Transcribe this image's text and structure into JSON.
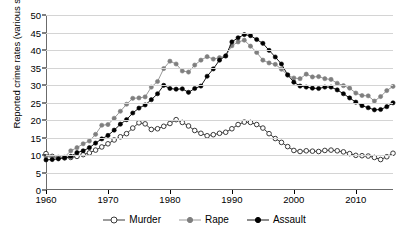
{
  "chart_data": {
    "type": "line",
    "title": "",
    "xlabel": "",
    "ylabel": "Reported crime rates (various scales)",
    "xlim": [
      1960,
      2016
    ],
    "ylim": [
      0,
      50
    ],
    "ytick_values": [
      0,
      5,
      10,
      15,
      20,
      25,
      30,
      35,
      40,
      45,
      50
    ],
    "ytick_labels": [
      "0",
      "5",
      "10",
      "15",
      "20",
      "25",
      "30",
      "35",
      "40",
      "45",
      "50"
    ],
    "xtick_values": [
      1960,
      1970,
      1980,
      1990,
      2000,
      2010
    ],
    "xtick_labels": [
      "1960",
      "1970",
      "1980",
      "1990",
      "2000",
      "2010"
    ],
    "grid": "horizontal",
    "legend_position": "bottom",
    "x": [
      1960,
      1961,
      1962,
      1963,
      1964,
      1965,
      1966,
      1967,
      1968,
      1969,
      1970,
      1971,
      1972,
      1973,
      1974,
      1975,
      1976,
      1977,
      1978,
      1979,
      1980,
      1981,
      1982,
      1983,
      1984,
      1985,
      1986,
      1987,
      1988,
      1989,
      1990,
      1991,
      1992,
      1993,
      1994,
      1995,
      1996,
      1997,
      1998,
      1999,
      2000,
      2001,
      2002,
      2003,
      2004,
      2005,
      2006,
      2007,
      2008,
      2009,
      2010,
      2011,
      2012,
      2013,
      2014,
      2015,
      2016
    ],
    "series": [
      {
        "name": "Murder",
        "color": "#ffffff",
        "line_color": "#3a3a3a",
        "marker": "open-circle",
        "values": [
          10.4,
          9.6,
          9.2,
          9.2,
          9.3,
          9.6,
          10.1,
          10.6,
          11.4,
          12.3,
          13.2,
          14.3,
          15.2,
          16.1,
          17.7,
          19.2,
          18.9,
          17.3,
          17.5,
          18.2,
          19.0,
          20.1,
          19.3,
          18.3,
          17.0,
          16.2,
          15.5,
          15.8,
          16.2,
          16.5,
          17.5,
          18.7,
          19.4,
          19.3,
          18.7,
          17.7,
          16.1,
          14.7,
          13.6,
          12.4,
          11.3,
          11.0,
          11.2,
          11.1,
          11.0,
          11.3,
          11.4,
          11.2,
          10.9,
          10.4,
          9.9,
          9.8,
          9.7,
          9.3,
          8.7,
          9.5,
          10.5
        ]
      },
      {
        "name": "Rape",
        "color": "#7f7f7f",
        "line_color": "#9a9a9a",
        "marker": "filled-circle",
        "values": [
          9.6,
          9.4,
          9.4,
          9.4,
          11.2,
          12.1,
          13.2,
          14.0,
          15.9,
          18.5,
          18.7,
          20.5,
          22.5,
          24.5,
          26.2,
          26.3,
          26.6,
          29.4,
          31.0,
          34.7,
          36.8,
          36.0,
          34.0,
          33.7,
          35.7,
          37.1,
          38.1,
          37.4,
          37.8,
          38.3,
          41.2,
          42.3,
          42.8,
          41.1,
          39.3,
          37.1,
          36.3,
          35.9,
          34.5,
          32.8,
          32.0,
          31.8,
          33.1,
          32.3,
          32.4,
          31.8,
          31.6,
          30.5,
          29.8,
          29.1,
          27.7,
          27.0,
          26.9,
          25.4,
          26.7,
          28.4,
          29.6
        ]
      },
      {
        "name": "Assault",
        "color": "#000000",
        "line_color": "#1a1a1a",
        "marker": "filled-circle",
        "values": [
          8.6,
          8.7,
          8.9,
          9.2,
          9.6,
          10.7,
          11.2,
          12.1,
          13.4,
          14.6,
          15.6,
          17.1,
          18.8,
          20.1,
          22.0,
          23.4,
          24.3,
          25.8,
          27.5,
          29.9,
          29.0,
          28.8,
          28.9,
          27.9,
          29.0,
          29.7,
          32.5,
          34.6,
          37.1,
          38.3,
          42.3,
          43.5,
          44.4,
          44.1,
          43.0,
          41.9,
          39.9,
          38.0,
          36.0,
          32.9,
          30.8,
          29.7,
          29.4,
          29.1,
          29.0,
          29.4,
          29.4,
          28.6,
          27.5,
          26.3,
          25.1,
          24.1,
          23.5,
          22.9,
          23.0,
          23.8,
          24.9
        ]
      }
    ]
  },
  "legend": {
    "items": [
      {
        "label": "Murder",
        "marker": "open-circle"
      },
      {
        "label": "Rape",
        "marker": "gray-dot"
      },
      {
        "label": "Assault",
        "marker": "black-dot"
      }
    ]
  }
}
